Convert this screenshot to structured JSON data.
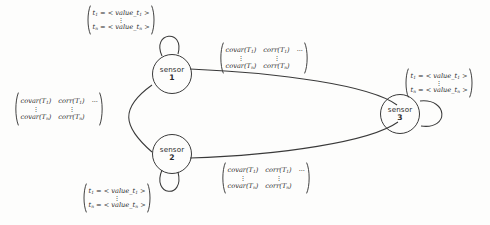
{
  "diagram": {
    "stroke_color": "#3a3a3a",
    "text_color": "#2d2d2d",
    "background_color": "#fdfdfc",
    "nodes": [
      {
        "id": "sensor-1",
        "label": "sensor",
        "index": "1"
      },
      {
        "id": "sensor-2",
        "label": "sensor",
        "index": "2"
      },
      {
        "id": "sensor-3",
        "label": "sensor",
        "index": "3"
      }
    ],
    "vector_labels": [
      {
        "id": "vector-sensor-1",
        "first_var": "t",
        "first_sub": "1",
        "first_value": "value_t",
        "first_value_sub": "1",
        "last_var": "t",
        "last_sub": "n",
        "last_value": "value_t",
        "last_value_sub": "n",
        "eq": "=",
        "open_angle": "<",
        "close_angle": ">",
        "vdots": "⋮"
      },
      {
        "id": "vector-sensor-2",
        "first_var": "t",
        "first_sub": "1",
        "first_value": "value_t",
        "first_value_sub": "1",
        "last_var": "t",
        "last_sub": "n",
        "last_value": "value_t",
        "last_value_sub": "n",
        "eq": "=",
        "open_angle": "<",
        "close_angle": ">",
        "vdots": "⋮"
      },
      {
        "id": "vector-sensor-3",
        "first_var": "t",
        "first_sub": "1",
        "first_value": "value_t",
        "first_value_sub": "1",
        "last_var": "t",
        "last_sub": "n",
        "last_value": "value_t",
        "last_value_sub": "n",
        "eq": "=",
        "open_angle": "<",
        "close_angle": ">",
        "vdots": "⋮"
      }
    ],
    "matrix_labels": [
      {
        "id": "matrix-edge-left",
        "col1_first": "covar(T",
        "col1_first_sub": "1",
        "col1_last": "covar(T",
        "col1_last_sub": "n",
        "col2_first": "corr(T",
        "col2_first_sub": "1",
        "col2_last": "corr(T",
        "col2_last_sub": "n",
        "close_paren": ")",
        "vdots": "⋮",
        "ellipsis": "...",
        "sep": "."
      },
      {
        "id": "matrix-edge-1-3",
        "col1_first": "covar(T",
        "col1_first_sub": "1",
        "col1_last": "covar(T",
        "col1_last_sub": "n",
        "col2_first": "corr(T",
        "col2_first_sub": "1",
        "col2_last": "corr(T",
        "col2_last_sub": "n",
        "close_paren": ")",
        "vdots": "⋮",
        "ellipsis": "...",
        "sep": "."
      },
      {
        "id": "matrix-edge-2-3",
        "col1_first": "covar(T",
        "col1_first_sub": "1",
        "col1_last": "covar(T",
        "col1_last_sub": "n",
        "col2_first": "corr(T",
        "col2_first_sub": "1",
        "col2_last": "corr(T",
        "col2_last_sub": "n",
        "close_paren": ")",
        "vdots": "⋮",
        "ellipsis": "...",
        "sep": "."
      }
    ]
  }
}
